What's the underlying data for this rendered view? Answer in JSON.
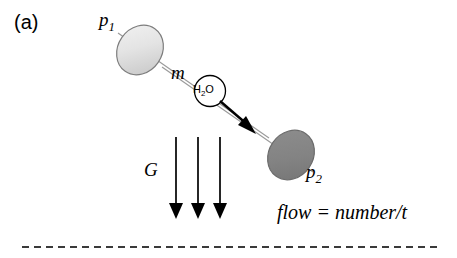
{
  "figure": {
    "panel_label": "(a)",
    "width": 457,
    "height": 258,
    "background_color": "#ffffff"
  },
  "labels": {
    "p1": "p",
    "p1_sub": "1",
    "p2": "p",
    "p2_sub": "2",
    "mass": "m",
    "gravity": "G",
    "molecule_main": "H",
    "molecule_sub": "2",
    "molecule_tail": "O"
  },
  "equation": {
    "text": "flow = number/t"
  },
  "colors": {
    "tube_outline": "#8c8c8c",
    "tube_body": "#ffffff",
    "cap_p1_light": "#ededed",
    "cap_p1_dark": "#c9c9c9",
    "cap_p1_outline": "#7a7a7a",
    "cap_p2_fill": "#808080",
    "cap_p2_outline": "#6b6b6b",
    "arrow_black": "#000000",
    "dashed_line": "#3a3a3a",
    "text": "#000000"
  },
  "geometry": {
    "tube_start": {
      "x": 140,
      "y": 50
    },
    "tube_end": {
      "x": 291,
      "y": 155
    },
    "flow_arrow_start": {
      "x": 219,
      "y": 102
    },
    "flow_arrow_end": {
      "x": 256,
      "y": 134
    },
    "molecule_circle": {
      "cx": 210,
      "cy": 91,
      "r": 15
    },
    "gravity_arrows_x": [
      176,
      198,
      220
    ],
    "gravity_arrow_top_y": 137,
    "gravity_arrow_bottom_y": 219,
    "baseline_y": 247,
    "baseline_x_start": 22,
    "baseline_x_end": 437
  }
}
